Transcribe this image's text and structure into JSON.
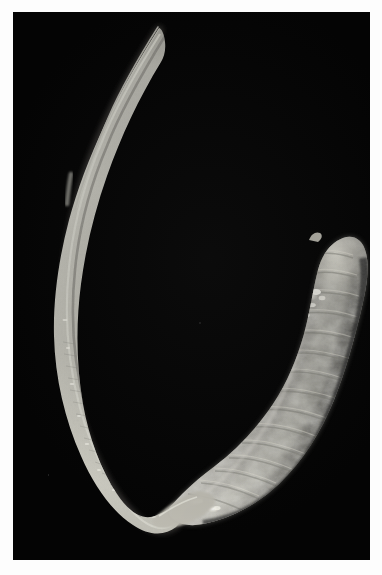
{
  "image": {
    "kind": "specimen-photograph",
    "medium": "black-and-white photographic print",
    "subject_common_name": "spoon worm (echiuran)",
    "subject_description": "Whole preserved marine worm on a black background: a long slender tapering proboscis sweeps from upper left in a wide arc down to a U-bend at lower left, then joins a thick, curved, knobbly, annulated trunk occupying the right half of the frame.",
    "orientation": "portrait",
    "background_color": "#040404",
    "mount_color": "#fdfdfd",
    "specimen_base_color": "#b4b2a8",
    "specimen_highlight_color": "#f2f1ea",
    "specimen_shadow_color": "#4e4d47"
  },
  "plate": {
    "left": 13,
    "top": 12,
    "width": 357,
    "height": 548
  },
  "features": [
    {
      "name": "proboscis-tip",
      "label": "Proboscis distal tip",
      "note": "Finest free end of the proboscis at upper left of the plate.",
      "x": 145,
      "y": 16,
      "relative_width_px": 1
    },
    {
      "name": "proboscis-shaft",
      "label": "Proboscis shaft",
      "note": "Long filiform ribbon that widens gradually as it descends and curves leftward.",
      "relative_width_px": 5
    },
    {
      "name": "proboscis-thickening",
      "label": "Proboscis basal thickening",
      "note": "Abrupt widening of the proboscis ribbon about two fifths of the way down the arc.",
      "x": 57,
      "y": 166
    },
    {
      "name": "proboscis-bend",
      "label": "U-bend of proboscis",
      "note": "Lowest point of the sweeping arc at the bottom left of the plate.",
      "x": 110,
      "y": 513
    },
    {
      "name": "proboscis-trunk-junction",
      "label": "Proboscis–trunk junction",
      "note": "Narrow neck where the proboscis meets the anterior end of the trunk.",
      "x": 172,
      "y": 487
    },
    {
      "name": "trunk",
      "label": "Trunk (body)",
      "note": "Stout, banana-shaped, transversely wrinkled body bearing irregular pale papillae along its surface.",
      "x": 265,
      "y": 370
    },
    {
      "name": "trunk-posterior-end",
      "label": "Rounded posterior end of trunk",
      "note": "Broad, bluntly rounded end at upper right of the trunk.",
      "x": 322,
      "y": 245
    },
    {
      "name": "terminal-papilla",
      "label": "Small terminal papilla",
      "note": "Tiny nub projecting from the top of the rounded posterior end.",
      "x": 305,
      "y": 229
    },
    {
      "name": "surface-papillae",
      "label": "Pale surface papillae",
      "note": "Clusters of bright, glistening tubercles scattered along the lower-left flank of the trunk."
    },
    {
      "name": "annulations",
      "label": "Transverse annulations",
      "note": "Ring-like wrinkles crossing the trunk, giving it a segmented appearance."
    }
  ]
}
